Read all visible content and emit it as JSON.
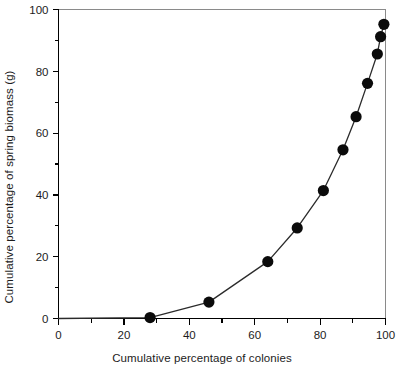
{
  "chart_data": {
    "type": "line",
    "title": "",
    "xlabel": "Cumulative percentage of colonies",
    "ylabel": "Cumulative percentage of spring biomass (g)",
    "xlim": [
      0,
      100
    ],
    "ylim": [
      0,
      100
    ],
    "grid": false,
    "legend": "none",
    "x_ticks_major": [
      0,
      20,
      40,
      60,
      80,
      100
    ],
    "x_ticks_minor": [
      10,
      30,
      50,
      70,
      90
    ],
    "y_ticks_major": [
      0,
      20,
      40,
      60,
      80,
      100
    ],
    "y_ticks_minor": [
      10,
      30,
      50,
      70,
      90
    ],
    "x_tick_labels": [
      "0",
      "20",
      "40",
      "60",
      "80",
      "100"
    ],
    "y_tick_labels": [
      "0",
      "20",
      "40",
      "60",
      "80",
      "100"
    ],
    "series": [
      {
        "name": "cumulative biomass",
        "marker": "filled-circle",
        "marker_color": "#0b0b0b",
        "line_color": "#2b2b2b",
        "x": [
          0,
          28,
          46,
          64,
          73,
          81,
          87,
          91,
          94.5,
          97.5,
          98.5,
          99.5
        ],
        "y": [
          0,
          0.3,
          5.3,
          18.4,
          29.3,
          41.4,
          54.6,
          65.3,
          76.1,
          85.6,
          91.2,
          95.2
        ],
        "marker_indices": [
          1,
          2,
          3,
          4,
          5,
          6,
          7,
          8,
          9,
          10,
          11
        ]
      }
    ],
    "points_labeled": [
      {
        "x": 28,
        "y": 0.3
      },
      {
        "x": 46,
        "y": 5.3
      },
      {
        "x": 64,
        "y": 18.4
      },
      {
        "x": 73,
        "y": 29.3
      },
      {
        "x": 81,
        "y": 41.4
      },
      {
        "x": 87,
        "y": 54.6
      },
      {
        "x": 91,
        "y": 65.3
      },
      {
        "x": 94.5,
        "y": 76.1
      },
      {
        "x": 97.5,
        "y": 85.6
      },
      {
        "x": 98.5,
        "y": 91.2
      },
      {
        "x": 99.5,
        "y": 95.2
      }
    ],
    "colors": {
      "background": "#ffffff",
      "axis": "#000000",
      "frame": "#8a8a8a",
      "marker": "#0b0b0b",
      "line": "#2b2b2b",
      "text": "#1c1c1c"
    }
  }
}
